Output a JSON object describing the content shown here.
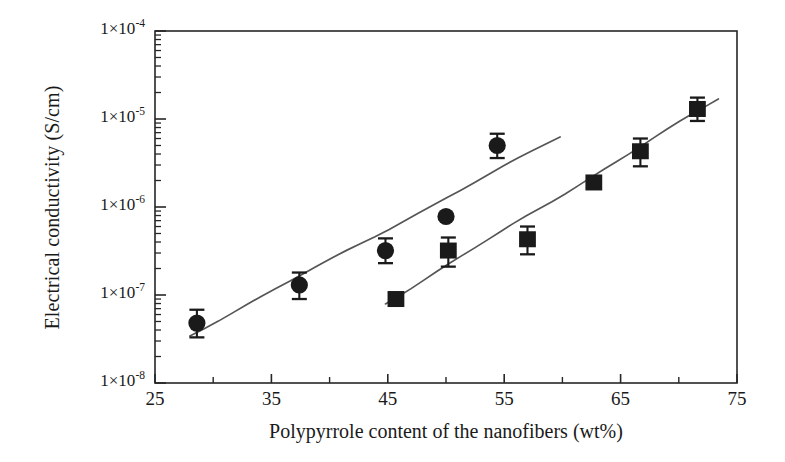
{
  "chart_data": {
    "type": "scatter",
    "title": "",
    "xlabel": "Polypyrrole content of the nanofibers (wt%)",
    "ylabel": "Electrical conductivity (S/cm)",
    "xlim": [
      25,
      75
    ],
    "ylim": [
      1e-08,
      0.0001
    ],
    "yscale": "log",
    "grid": false,
    "legend": "none",
    "xticks": [
      25,
      35,
      45,
      55,
      65,
      75
    ],
    "xtick_labels": [
      "25",
      "35",
      "45",
      "55",
      "65",
      "75"
    ],
    "xminor_ticks": [
      30,
      40,
      50,
      60,
      70
    ],
    "yticks": [
      0.0001,
      1e-05,
      1e-06,
      1e-07,
      1e-08
    ],
    "ytick_labels": [
      "1×10⁻⁴",
      "1×10⁻⁵",
      "1×10⁻⁶",
      "1×10⁻⁷",
      "1×10⁻⁸"
    ],
    "ytick_mantissa": "1×10",
    "ytick_exponents": [
      "-4",
      "-5",
      "-6",
      "-7",
      "-8"
    ],
    "series": [
      {
        "name": "circles",
        "marker": "circle",
        "color": "#1a1a1a",
        "points": [
          {
            "x": 28.6,
            "y": 4.8e-08,
            "yerr_up": 2e-08,
            "yerr_dn": 1.5e-08
          },
          {
            "x": 37.4,
            "y": 1.3e-07,
            "yerr_up": 5e-08,
            "yerr_dn": 4e-08
          },
          {
            "x": 44.8,
            "y": 3.2e-07,
            "yerr_up": 1.2e-07,
            "yerr_dn": 9e-08
          },
          {
            "x": 50.0,
            "y": 7.8e-07,
            "yerr_up": 0,
            "yerr_dn": 0
          },
          {
            "x": 54.4,
            "y": 5e-06,
            "yerr_up": 1.8e-06,
            "yerr_dn": 1.4e-06
          }
        ]
      },
      {
        "name": "squares",
        "marker": "square",
        "color": "#1a1a1a",
        "points": [
          {
            "x": 45.7,
            "y": 9e-08,
            "yerr_up": 0,
            "yerr_dn": 0
          },
          {
            "x": 50.2,
            "y": 3.2e-07,
            "yerr_up": 1.3e-07,
            "yerr_dn": 1.1e-07
          },
          {
            "x": 57.0,
            "y": 4.3e-07,
            "yerr_up": 1.7e-07,
            "yerr_dn": 1.4e-07
          },
          {
            "x": 62.7,
            "y": 1.9e-06,
            "yerr_up": 0,
            "yerr_dn": 0
          },
          {
            "x": 66.7,
            "y": 4.3e-06,
            "yerr_up": 1.7e-06,
            "yerr_dn": 1.4e-06
          },
          {
            "x": 71.6,
            "y": 1.3e-05,
            "yerr_up": 4.5e-06,
            "yerr_dn": 3.5e-06
          }
        ]
      }
    ],
    "trendlines": [
      {
        "name": "circles-fit",
        "x0": 28.0,
        "y0": 3.5e-08,
        "x1": 59.8,
        "y1": 6.3e-06
      },
      {
        "name": "squares-fit",
        "x0": 44.8,
        "y0": 8.1e-08,
        "x1": 73.4,
        "y1": 1.7e-05
      }
    ]
  }
}
